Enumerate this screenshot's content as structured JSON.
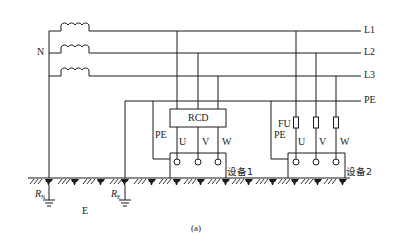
{
  "diagram": {
    "caption": "(a)",
    "lines": {
      "l1": "L1",
      "l2": "L2",
      "l3": "L3",
      "pe": "PE"
    },
    "neutral_label": "N",
    "earth_label": "E",
    "rn_label": "R",
    "rn_sub": "N",
    "re_label": "R",
    "re_sub": "E",
    "rcd_label": "RCD",
    "fuse_label": "FU",
    "equipment1": {
      "name": "设备1",
      "pe_label": "PE",
      "terminals": [
        "U",
        "V",
        "W"
      ]
    },
    "equipment2": {
      "name": "设备2",
      "pe_label": "PE",
      "terminals": [
        "U",
        "V",
        "W"
      ]
    },
    "colors": {
      "stroke": "#1a1a1a",
      "background": "#ffffff"
    }
  }
}
